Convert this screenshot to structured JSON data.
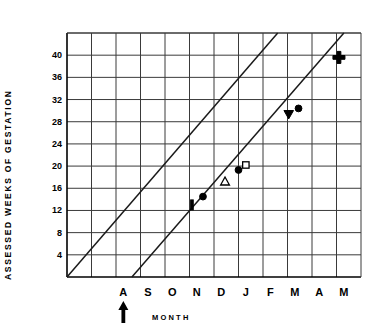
{
  "chart_data": {
    "type": "scatter",
    "title": "",
    "xlabel": "MONTH",
    "ylabel": "ASSESSED WEEKS OF GESTATION",
    "ylim": [
      0,
      44
    ],
    "yticks": [
      4,
      8,
      12,
      16,
      20,
      24,
      28,
      32,
      36,
      40
    ],
    "ytick_labels": [
      "4",
      "8",
      "12",
      "16",
      "20",
      "24",
      "28",
      "32",
      "36",
      "40"
    ],
    "xticks": [
      1,
      2,
      3,
      4,
      5,
      6,
      7,
      8,
      9,
      10
    ],
    "categories": [
      "A",
      "S",
      "O",
      "N",
      "D",
      "J",
      "F",
      "M",
      "A",
      "M"
    ],
    "xtick_labels": [
      "A",
      "S",
      "O",
      "N",
      "D",
      "J",
      "F",
      "M",
      "A",
      "M"
    ],
    "grid": true,
    "legend": false,
    "annotations": [
      {
        "name": "conception-arrow",
        "symbol": "up-arrow",
        "x_category": "A",
        "label": ""
      }
    ],
    "series": [
      {
        "name": "upper reference line",
        "type": "line",
        "points": [
          {
            "x": 0.0,
            "y": 0
          },
          {
            "x": 8.6,
            "y": 44
          }
        ]
      },
      {
        "name": "lower gestation line",
        "type": "line",
        "points": [
          {
            "x": 2.65,
            "y": 0
          },
          {
            "x": 11.3,
            "y": 44
          }
        ]
      },
      {
        "name": "assessed gestation points",
        "type": "scatter",
        "points": [
          {
            "marker": "vertical-bar",
            "x_month": "D",
            "x": 5.1,
            "y": 13.0
          },
          {
            "marker": "filled-circle",
            "x_month": "D",
            "x": 5.55,
            "y": 14.5
          },
          {
            "marker": "open-triangle",
            "x_month": "J",
            "x": 6.45,
            "y": 17.2
          },
          {
            "marker": "filled-circle",
            "x_month": "J",
            "x": 7.0,
            "y": 19.3
          },
          {
            "marker": "open-square",
            "x_month": "J",
            "x": 7.3,
            "y": 20.2
          },
          {
            "marker": "filled-down-triangle",
            "x_month": "M",
            "x": 9.05,
            "y": 29.3
          },
          {
            "marker": "filled-circle",
            "x_month": "M",
            "x": 9.45,
            "y": 30.4
          },
          {
            "marker": "plus-cross",
            "x_month": "M",
            "x": 11.1,
            "y": 39.6
          }
        ]
      }
    ]
  },
  "axes": {
    "y_title": "ASSESSED WEEKS OF GESTATION",
    "x_title": "MONTH"
  }
}
